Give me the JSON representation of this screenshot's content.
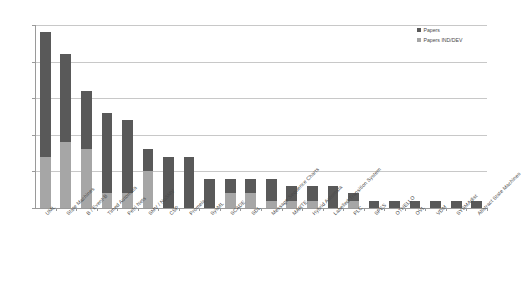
{
  "chart_data": {
    "type": "bar",
    "title": "",
    "xlabel": "",
    "ylabel": "",
    "ylim": [
      0,
      25
    ],
    "yticks": [
      0,
      5,
      10,
      15,
      20,
      25
    ],
    "grid": true,
    "stacked": true,
    "legend_position": "top-right",
    "categories": [
      "UML",
      "State Machines",
      "B / Event-B",
      "Timed Automata",
      "Petri Nets",
      "SMV / NuSMV",
      "CSP",
      "Promela",
      "SysML",
      "SCADE",
      "SDL",
      "Message Sequence Charts",
      "MARTE",
      "Hybrid Automata",
      "Labelled Transition System",
      "PLC",
      "SPES",
      "OTHELLO",
      "OVL",
      "VDM",
      "SYSMAdist",
      "Abstract State Machines"
    ],
    "series": [
      {
        "name": "Papers",
        "color": "#595959",
        "values": [
          17,
          12,
          8,
          11,
          10,
          3,
          7,
          7,
          4,
          2,
          2,
          3,
          2,
          2,
          3,
          1,
          1,
          1,
          1,
          1,
          1,
          1
        ]
      },
      {
        "name": "Papers IND/DEV",
        "color": "#a6a6a6",
        "values": [
          7,
          9,
          8,
          2,
          2,
          5,
          0,
          0,
          0,
          2,
          2,
          1,
          1,
          1,
          0,
          1,
          0,
          0,
          0,
          0,
          0,
          0
        ]
      }
    ],
    "totals": [
      24,
      21,
      16,
      13,
      12,
      8,
      7,
      7,
      4,
      4,
      4,
      4,
      3,
      3,
      3,
      2,
      1,
      1,
      1,
      1,
      1,
      1
    ]
  },
  "legend": {
    "items": [
      {
        "label": "Papers",
        "color": "#595959"
      },
      {
        "label": "Papers IND/DEV",
        "color": "#a6a6a6"
      }
    ]
  },
  "axis": {
    "y_tick_labels": [
      "0",
      "5",
      "10",
      "15",
      "20",
      "25"
    ]
  }
}
